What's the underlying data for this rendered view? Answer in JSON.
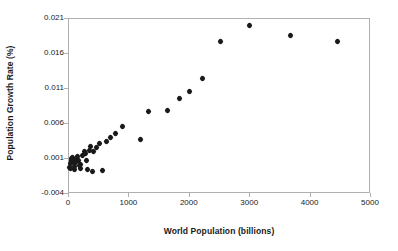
{
  "chart_data": {
    "type": "scatter",
    "title": "",
    "xlabel": "World Population (billions)",
    "ylabel": "Population Growth Rate (%)",
    "xlim": [
      0,
      5000
    ],
    "ylim": [
      -0.004,
      0.021
    ],
    "xticks": [
      "0",
      "1000",
      "2000",
      "3000",
      "4000",
      "5000"
    ],
    "xtick_values": [
      0,
      1000,
      2000,
      3000,
      4000,
      5000
    ],
    "yticks": [
      "-0.004",
      "0.001",
      "0.006",
      "0.011",
      "0.016",
      "0.021"
    ],
    "ytick_values": [
      -0.004,
      0.001,
      0.006,
      0.011,
      0.016,
      0.021
    ],
    "grid": false,
    "legend": false,
    "marker": "diamond",
    "marker_color": "#1a1a1a",
    "points": [
      {
        "x": 20,
        "y": -0.0003
      },
      {
        "x": 35,
        "y": -0.0005
      },
      {
        "x": 45,
        "y": 0.0002
      },
      {
        "x": 55,
        "y": 0.0006
      },
      {
        "x": 60,
        "y": 0.001
      },
      {
        "x": 70,
        "y": 0.0011
      },
      {
        "x": 80,
        "y": 0.0008
      },
      {
        "x": 90,
        "y": 0.0003
      },
      {
        "x": 100,
        "y": -0.0002
      },
      {
        "x": 110,
        "y": -0.0006
      },
      {
        "x": 125,
        "y": 0.0004
      },
      {
        "x": 140,
        "y": 0.0009
      },
      {
        "x": 155,
        "y": 0.0012
      },
      {
        "x": 170,
        "y": 0.0007
      },
      {
        "x": 185,
        "y": 0.0
      },
      {
        "x": 200,
        "y": -0.0005
      },
      {
        "x": 215,
        "y": 0.0001
      },
      {
        "x": 240,
        "y": 0.0013
      },
      {
        "x": 265,
        "y": 0.0019
      },
      {
        "x": 290,
        "y": 0.0016
      },
      {
        "x": 310,
        "y": 0.0006
      },
      {
        "x": 330,
        "y": -0.0007
      },
      {
        "x": 355,
        "y": 0.0021
      },
      {
        "x": 375,
        "y": 0.0026
      },
      {
        "x": 400,
        "y": -0.0009
      },
      {
        "x": 430,
        "y": 0.002
      },
      {
        "x": 470,
        "y": 0.0025
      },
      {
        "x": 520,
        "y": 0.0031
      },
      {
        "x": 570,
        "y": -0.0008
      },
      {
        "x": 640,
        "y": 0.0033
      },
      {
        "x": 700,
        "y": 0.004
      },
      {
        "x": 780,
        "y": 0.0045
      },
      {
        "x": 900,
        "y": 0.0055
      },
      {
        "x": 1200,
        "y": 0.0036
      },
      {
        "x": 1340,
        "y": 0.0077
      },
      {
        "x": 1640,
        "y": 0.0078
      },
      {
        "x": 1840,
        "y": 0.0095
      },
      {
        "x": 2010,
        "y": 0.0105
      },
      {
        "x": 2220,
        "y": 0.0124
      },
      {
        "x": 2520,
        "y": 0.0177
      },
      {
        "x": 3010,
        "y": 0.0199
      },
      {
        "x": 3690,
        "y": 0.0185
      },
      {
        "x": 4460,
        "y": 0.0176
      }
    ]
  }
}
